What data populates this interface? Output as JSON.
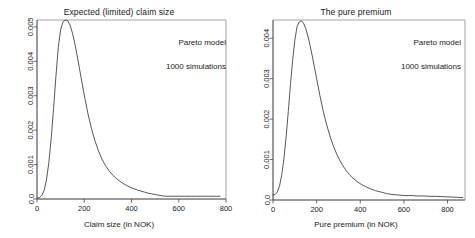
{
  "figure": {
    "background": "#ffffff",
    "line_color": "#3a3a3a",
    "axis_color": "#4a4a4a"
  },
  "chart_data": [
    {
      "type": "line",
      "panel": "left",
      "title": "Expected (limited) claim size",
      "xlabel": "Claim size (in NOK)",
      "ylabel": "",
      "xlim": [
        0,
        800
      ],
      "ylim": [
        0,
        0.0052
      ],
      "xticks": [
        0,
        200,
        400,
        600,
        800
      ],
      "xticklabels": [
        "0",
        "200",
        "400",
        "600",
        "800"
      ],
      "yticks": [
        0.0,
        0.001,
        0.002,
        0.003,
        0.004,
        0.005
      ],
      "yticklabels": [
        "0.0",
        "0.001",
        "0.002",
        "0.003",
        "0.004",
        "0.005"
      ],
      "grid": false,
      "legend": null,
      "annotations": [
        "Pareto model",
        "1000 simulations"
      ],
      "x": [
        0,
        10,
        20,
        30,
        40,
        50,
        60,
        70,
        80,
        90,
        100,
        110,
        120,
        130,
        140,
        150,
        160,
        170,
        180,
        190,
        200,
        215,
        230,
        245,
        260,
        275,
        290,
        305,
        320,
        335,
        350,
        365,
        380,
        395,
        410,
        425,
        440,
        455,
        470,
        485,
        500,
        515,
        530,
        550,
        575,
        600,
        625,
        650,
        675,
        700,
        725,
        750,
        775
      ],
      "y": [
        2e-05,
        4e-05,
        0.0001,
        0.00024,
        0.00055,
        0.00105,
        0.00175,
        0.00262,
        0.00355,
        0.0044,
        0.00492,
        0.00515,
        0.0052,
        0.00518,
        0.00505,
        0.00482,
        0.00452,
        0.00416,
        0.00378,
        0.0034,
        0.00302,
        0.0025,
        0.00206,
        0.0017,
        0.0014,
        0.00116,
        0.00097,
        0.00082,
        0.0007,
        0.0006,
        0.00052,
        0.00045,
        0.00039,
        0.00034,
        0.0003,
        0.00026,
        0.00023,
        0.0002,
        0.00017,
        0.00015,
        0.00013,
        0.00011,
        9e-05,
        8e-05,
        8e-05,
        8e-05,
        8e-05,
        8e-05,
        8e-05,
        8e-05,
        8e-05,
        8e-05,
        8e-05
      ]
    },
    {
      "type": "line",
      "panel": "right",
      "title": "The pure premium",
      "xlabel": "Pure premium (in NOK)",
      "ylabel": "",
      "xlim": [
        0,
        880
      ],
      "ylim": [
        0,
        0.00445
      ],
      "xticks": [
        0,
        200,
        400,
        600,
        800
      ],
      "xticklabels": [
        "0",
        "200",
        "400",
        "600",
        "800"
      ],
      "yticks": [
        0.0,
        0.001,
        0.002,
        0.003,
        0.004
      ],
      "yticklabels": [
        "0.0",
        "0.001",
        "0.002",
        "0.003",
        "0.004"
      ],
      "grid": false,
      "legend": null,
      "annotations": [
        "Pareto model",
        "1000 simulations"
      ],
      "x": [
        0,
        10,
        20,
        30,
        40,
        50,
        60,
        70,
        80,
        90,
        100,
        110,
        120,
        130,
        140,
        150,
        160,
        170,
        180,
        190,
        200,
        215,
        230,
        245,
        260,
        275,
        290,
        305,
        320,
        335,
        350,
        365,
        380,
        395,
        410,
        425,
        440,
        455,
        470,
        485,
        500,
        520,
        540,
        560,
        580,
        600,
        620,
        640,
        660,
        690,
        720,
        750,
        790,
        830,
        870
      ],
      "y": [
        0.00012,
        0.00014,
        0.0002,
        0.00035,
        0.00062,
        0.00102,
        0.00155,
        0.00218,
        0.00285,
        0.00345,
        0.00395,
        0.00428,
        0.0044,
        0.00443,
        0.00437,
        0.00424,
        0.00405,
        0.00382,
        0.00356,
        0.00328,
        0.003,
        0.00258,
        0.0022,
        0.00188,
        0.0016,
        0.00136,
        0.00116,
        0.00099,
        0.00085,
        0.00073,
        0.00063,
        0.00055,
        0.00048,
        0.00042,
        0.00037,
        0.00033,
        0.00029,
        0.00026,
        0.00023,
        0.00021,
        0.00019,
        0.00016,
        0.00014,
        0.00013,
        0.00012,
        0.00011,
        0.00011,
        0.00011,
        0.0001,
        0.0001,
        9e-05,
        9e-05,
        8e-05,
        7e-05,
        6e-05
      ]
    }
  ]
}
